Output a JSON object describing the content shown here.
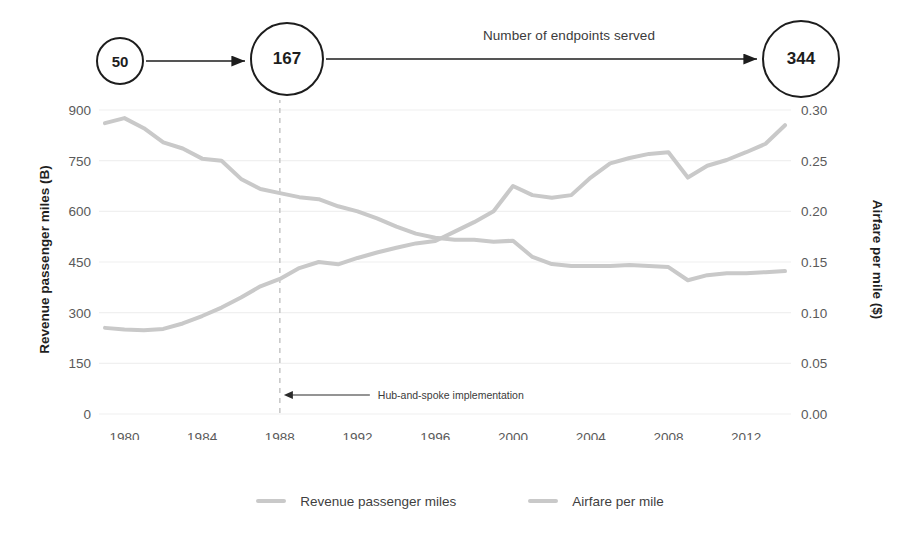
{
  "flow": {
    "label": "Number of endpoints served",
    "nodes": [
      {
        "value": "50"
      },
      {
        "value": "167"
      },
      {
        "value": "344"
      }
    ]
  },
  "axes": {
    "left_title": "Revenue passenger miles (B)",
    "right_title": "Airfare per mile ($)",
    "left_ticks": [
      "900",
      "750",
      "600",
      "450",
      "300",
      "150",
      "0"
    ],
    "right_ticks": [
      "0.30",
      "0.25",
      "0.20",
      "0.15",
      "0.10",
      "0.05",
      "0.00"
    ],
    "x_ticks": [
      "1980",
      "1984",
      "1988",
      "1992",
      "1996",
      "2000",
      "2004",
      "2008",
      "2012"
    ]
  },
  "annotation": {
    "marker_label": "Hub-and-spoke implementation",
    "marker_year": 1988
  },
  "legend": {
    "items": [
      {
        "label": "Revenue passenger miles",
        "color": "#c9c9c9"
      },
      {
        "label": "Airfare per mile",
        "color": "#c9c9c9"
      }
    ]
  },
  "colors": {
    "line": "#c9c9c9",
    "grid": "#f0f0f0",
    "text": "#5a5a5a",
    "node_stroke": "#1d1d1d"
  },
  "chart_data": {
    "type": "line",
    "title": "",
    "xlabel": "",
    "ylabel": "Revenue passenger miles (B)",
    "y2label": "Airfare per mile ($)",
    "xlim": [
      1979,
      2014
    ],
    "ylim": [
      0,
      900
    ],
    "y2lim": [
      0.0,
      0.3
    ],
    "grid": true,
    "legend_position": "bottom",
    "x": [
      1979,
      1980,
      1981,
      1982,
      1983,
      1984,
      1985,
      1986,
      1987,
      1988,
      1989,
      1990,
      1991,
      1992,
      1993,
      1994,
      1995,
      1996,
      1997,
      1998,
      1999,
      2000,
      2001,
      2002,
      2003,
      2004,
      2005,
      2006,
      2007,
      2008,
      2009,
      2010,
      2011,
      2012,
      2013,
      2014
    ],
    "series": [
      {
        "name": "Revenue passenger miles",
        "axis": "left",
        "color": "#c9c9c9",
        "values": [
          255,
          250,
          248,
          252,
          268,
          290,
          315,
          345,
          378,
          400,
          432,
          450,
          443,
          462,
          478,
          492,
          505,
          512,
          540,
          568,
          600,
          675,
          648,
          640,
          648,
          700,
          742,
          758,
          770,
          775,
          700,
          735,
          752,
          775,
          800,
          855
        ]
      },
      {
        "name": "Airfare per mile",
        "axis": "right",
        "color": "#c9c9c9",
        "values": [
          0.287,
          0.292,
          0.282,
          0.268,
          0.262,
          0.252,
          0.25,
          0.232,
          0.222,
          0.218,
          0.214,
          0.212,
          0.205,
          0.2,
          0.193,
          0.185,
          0.178,
          0.174,
          0.172,
          0.172,
          0.17,
          0.171,
          0.155,
          0.148,
          0.146,
          0.146,
          0.146,
          0.147,
          0.146,
          0.145,
          0.132,
          0.137,
          0.139,
          0.139,
          0.14,
          0.141
        ]
      }
    ],
    "annotations": [
      {
        "type": "vline",
        "x": 1988,
        "style": "dashed",
        "label": "Hub-and-spoke implementation"
      }
    ]
  }
}
